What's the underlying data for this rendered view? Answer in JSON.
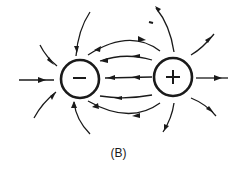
{
  "figure": {
    "caption": "(B)",
    "charges": [
      {
        "name": "negative-charge",
        "sign": "−"
      },
      {
        "name": "positive-charge",
        "sign": "+"
      }
    ],
    "stray_mark": "-",
    "ink_color": "#1a1a1a"
  }
}
